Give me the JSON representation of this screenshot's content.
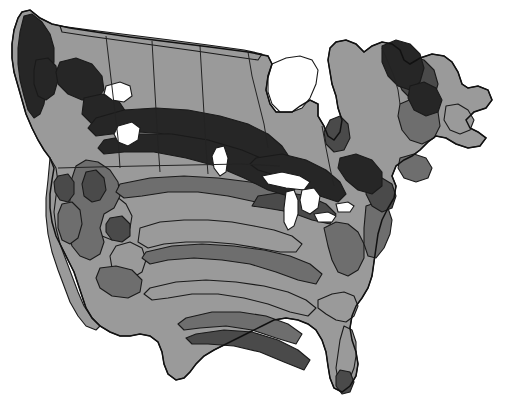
{
  "figure": {
    "projection_note": "conic, north-up",
    "background_color": "#ffffff",
    "outline_color": "#111111",
    "border_color": "#232323",
    "water_color": "#ffffff"
  },
  "legend_palette": {
    "zone_1_darkest": "#262626",
    "zone_2_dark": "#4a4a4a",
    "zone_3_medium": "#6e6e6e",
    "zone_4_light": "#9a9a9a",
    "zone_5_lightest": "#c8c8c8"
  },
  "zones": [
    {
      "id": "zone-lightest",
      "label": "Zone band 5 (lightest)",
      "color": "#c8c8c8",
      "regions": "Northern Canada, Arctic interior, Hudson Bay margins, central plains band, southern interior band"
    },
    {
      "id": "zone-light",
      "label": "Zone band 4 (light gray)",
      "color": "#9a9a9a",
      "regions": "Pacific coastal strip, intermountain west, southeastern coastal plain, Florida peninsula"
    },
    {
      "id": "zone-medium",
      "label": "Zone band 3 (medium gray)",
      "color": "#6e6e6e",
      "regions": "Rocky Mountain belt, mid-continent transitional band, Appalachian belt, Atlantic seaboard"
    },
    {
      "id": "zone-dark",
      "label": "Zone band 2 (dark gray)",
      "color": "#4a4a4a",
      "regions": "High western ranges, Great Lakes surroundings, Quebec-Labrador uplands, Gulf coastal fringe"
    },
    {
      "id": "zone-darkest",
      "label": "Zone band 1 (darkest)",
      "color": "#262626",
      "regions": "Alaska-Yukon ranges, boreal Canada belt, northern Great Lakes shore, Labrador highlands"
    }
  ],
  "water_bodies": [
    {
      "name": "Hudson Bay",
      "color": "#ffffff"
    },
    {
      "name": "Lake Superior",
      "color": "#ffffff"
    },
    {
      "name": "Lake Michigan",
      "color": "#ffffff"
    },
    {
      "name": "Lake Huron",
      "color": "#ffffff"
    },
    {
      "name": "Lake Erie",
      "color": "#ffffff"
    },
    {
      "name": "Lake Ontario",
      "color": "#ffffff"
    },
    {
      "name": "Great Slave Lake",
      "color": "#ffffff"
    },
    {
      "name": "Great Bear Lake",
      "color": "#ffffff"
    },
    {
      "name": "Lake Winnipeg",
      "color": "#ffffff"
    }
  ],
  "political_boundaries": [
    "British Columbia - Alberta",
    "Alberta - Saskatchewan",
    "Saskatchewan - Manitoba",
    "Manitoba - Ontario",
    "Ontario - Quebec",
    "Canada - United States (49th parallel)",
    "Quebec - Labrador"
  ],
  "annotations": []
}
